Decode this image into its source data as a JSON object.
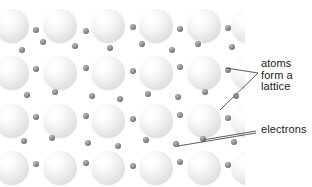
{
  "figure": {
    "background_color": "#ffffff"
  },
  "labels": {
    "atoms": "atoms\nform a\nlattice",
    "electrons": "electrons"
  },
  "colors": {
    "atom_fill": "#e8e8e8",
    "atom_highlight": "#ffffff",
    "electron_fill": "#6b6b6b",
    "leader_line": "#4a4a4a",
    "text": "#1b1b1b"
  },
  "lattice": {
    "atom_radius": 17,
    "electron_radius": 3,
    "rows": 4,
    "columns": 5,
    "atoms": [
      {
        "cx": 12,
        "cy": 26,
        "r": 17
      },
      {
        "cx": 60,
        "cy": 26,
        "r": 17
      },
      {
        "cx": 108,
        "cy": 26,
        "r": 17
      },
      {
        "cx": 156,
        "cy": 26,
        "r": 17
      },
      {
        "cx": 204,
        "cy": 26,
        "r": 17
      },
      {
        "cx": 248,
        "cy": 26,
        "r": 17
      },
      {
        "cx": 12,
        "cy": 73,
        "r": 17
      },
      {
        "cx": 60,
        "cy": 73,
        "r": 17
      },
      {
        "cx": 108,
        "cy": 73,
        "r": 17
      },
      {
        "cx": 156,
        "cy": 73,
        "r": 17
      },
      {
        "cx": 204,
        "cy": 73,
        "r": 17
      },
      {
        "cx": 248,
        "cy": 73,
        "r": 17
      },
      {
        "cx": 12,
        "cy": 121,
        "r": 17
      },
      {
        "cx": 60,
        "cy": 121,
        "r": 17
      },
      {
        "cx": 108,
        "cy": 121,
        "r": 17
      },
      {
        "cx": 156,
        "cy": 121,
        "r": 17
      },
      {
        "cx": 204,
        "cy": 121,
        "r": 17
      },
      {
        "cx": 248,
        "cy": 121,
        "r": 17
      },
      {
        "cx": 12,
        "cy": 168,
        "r": 17
      },
      {
        "cx": 60,
        "cy": 168,
        "r": 17
      },
      {
        "cx": 108,
        "cy": 168,
        "r": 17
      },
      {
        "cx": 156,
        "cy": 168,
        "r": 17
      },
      {
        "cx": 204,
        "cy": 168,
        "r": 17
      },
      {
        "cx": 248,
        "cy": 168,
        "r": 17
      }
    ],
    "electrons": [
      {
        "cx": 36,
        "cy": 30,
        "r": 3
      },
      {
        "cx": 86,
        "cy": 31,
        "r": 3
      },
      {
        "cx": 133,
        "cy": 27,
        "r": 3
      },
      {
        "cx": 180,
        "cy": 29,
        "r": 3
      },
      {
        "cx": 228,
        "cy": 28,
        "r": 3
      },
      {
        "cx": 22,
        "cy": 50,
        "r": 3
      },
      {
        "cx": 43,
        "cy": 42,
        "r": 3
      },
      {
        "cx": 75,
        "cy": 46,
        "r": 3
      },
      {
        "cx": 110,
        "cy": 48,
        "r": 3
      },
      {
        "cx": 142,
        "cy": 44,
        "r": 3
      },
      {
        "cx": 172,
        "cy": 50,
        "r": 3
      },
      {
        "cx": 198,
        "cy": 44,
        "r": 3
      },
      {
        "cx": 232,
        "cy": 47,
        "r": 3
      },
      {
        "cx": 36,
        "cy": 69,
        "r": 3
      },
      {
        "cx": 86,
        "cy": 68,
        "r": 3
      },
      {
        "cx": 133,
        "cy": 71,
        "r": 3
      },
      {
        "cx": 180,
        "cy": 67,
        "r": 3
      },
      {
        "cx": 228,
        "cy": 70,
        "r": 3
      },
      {
        "cx": 27,
        "cy": 95,
        "r": 3
      },
      {
        "cx": 55,
        "cy": 92,
        "r": 3
      },
      {
        "cx": 92,
        "cy": 96,
        "r": 3
      },
      {
        "cx": 120,
        "cy": 99,
        "r": 3
      },
      {
        "cx": 148,
        "cy": 94,
        "r": 3
      },
      {
        "cx": 178,
        "cy": 97,
        "r": 3
      },
      {
        "cx": 205,
        "cy": 92,
        "r": 3
      },
      {
        "cx": 236,
        "cy": 96,
        "r": 3
      },
      {
        "cx": 36,
        "cy": 117,
        "r": 3
      },
      {
        "cx": 86,
        "cy": 116,
        "r": 3
      },
      {
        "cx": 133,
        "cy": 119,
        "r": 3
      },
      {
        "cx": 180,
        "cy": 115,
        "r": 3
      },
      {
        "cx": 228,
        "cy": 118,
        "r": 3
      },
      {
        "cx": 24,
        "cy": 141,
        "r": 3
      },
      {
        "cx": 52,
        "cy": 138,
        "r": 3
      },
      {
        "cx": 88,
        "cy": 143,
        "r": 3
      },
      {
        "cx": 118,
        "cy": 146,
        "r": 3
      },
      {
        "cx": 146,
        "cy": 140,
        "r": 3
      },
      {
        "cx": 176,
        "cy": 144,
        "r": 3
      },
      {
        "cx": 203,
        "cy": 139,
        "r": 3
      },
      {
        "cx": 234,
        "cy": 142,
        "r": 3
      },
      {
        "cx": 36,
        "cy": 164,
        "r": 3
      },
      {
        "cx": 86,
        "cy": 163,
        "r": 3
      },
      {
        "cx": 133,
        "cy": 166,
        "r": 3
      },
      {
        "cx": 180,
        "cy": 162,
        "r": 3
      },
      {
        "cx": 228,
        "cy": 165,
        "r": 3
      }
    ]
  },
  "leader_lines": {
    "atoms": [
      {
        "x1": 226,
        "y1": 68,
        "x2": 258,
        "y2": 73
      },
      {
        "x1": 220,
        "y1": 110,
        "x2": 258,
        "y2": 73
      }
    ],
    "electrons": [
      {
        "x1": 203,
        "y1": 140,
        "x2": 256,
        "y2": 131
      },
      {
        "x1": 178,
        "y1": 146,
        "x2": 256,
        "y2": 133
      }
    ]
  }
}
